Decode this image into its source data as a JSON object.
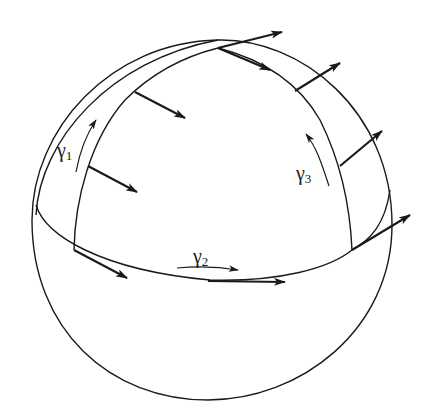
{
  "figure": {
    "stroke_color": "#1a1a1a",
    "background": "#ffffff"
  },
  "labels": {
    "gamma1": {
      "symbol": "γ",
      "sub": "1"
    },
    "gamma2": {
      "symbol": "γ",
      "sub": "2"
    },
    "gamma3": {
      "symbol": "γ",
      "sub": "3"
    }
  }
}
